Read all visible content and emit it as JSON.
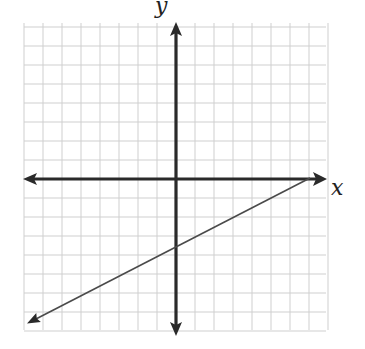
{
  "chart_data": {
    "type": "line",
    "title": "",
    "xlabel": "x",
    "ylabel": "y",
    "xlim": [
      -8,
      8
    ],
    "ylim": [
      -8,
      8
    ],
    "grid": true,
    "grid_step": 1,
    "tick_labels": false,
    "series": [
      {
        "name": "line",
        "equation": "y = 0.5x - 3.5",
        "slope": 0.5,
        "y_intercept": -3.5,
        "x_intercept": 7,
        "points": [
          {
            "x": -8,
            "y": -7.5
          },
          {
            "x": -1,
            "y": -4
          },
          {
            "x": 0,
            "y": -3.5
          },
          {
            "x": 1,
            "y": -3
          },
          {
            "x": 7,
            "y": 0
          }
        ],
        "arrow_ends": [
          "lower-left"
        ]
      }
    ]
  },
  "labels": {
    "x_axis": "x",
    "y_axis": "y"
  },
  "style": {
    "axis_color": "#2a2a2a",
    "grid_color": "#cfcfcf",
    "line_color": "#4a4a4a",
    "background": "#ffffff"
  },
  "layout": {
    "origin_px": [
      176,
      179
    ],
    "unit_px": 19
  }
}
